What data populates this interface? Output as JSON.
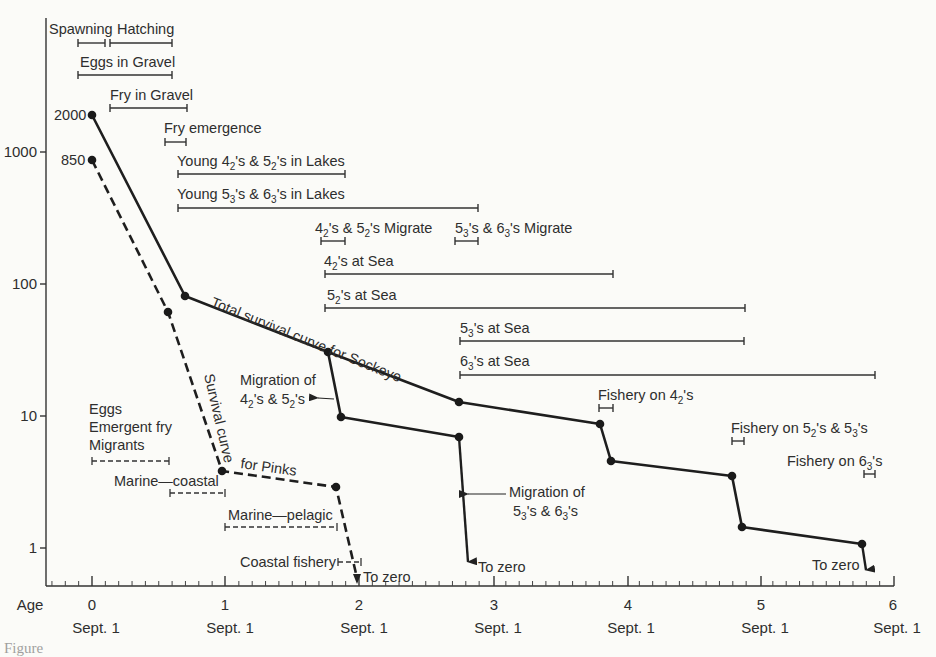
{
  "chart_data": {
    "type": "line",
    "title": "",
    "xlabel": "Age",
    "ylabel": "",
    "yscale": "log",
    "ylim": [
      0.5,
      5000
    ],
    "xlim": [
      -0.35,
      6.05
    ],
    "grid": false,
    "x_ticks": [
      {
        "value": 0,
        "label": "0",
        "sublabel": "Sept. 1"
      },
      {
        "value": 1,
        "label": "1",
        "sublabel": "Sept. 1"
      },
      {
        "value": 2,
        "label": "2",
        "sublabel": "Sept. 1"
      },
      {
        "value": 3,
        "label": "3",
        "sublabel": "Sept. 1"
      },
      {
        "value": 4,
        "label": "4",
        "sublabel": "Sept. 1"
      },
      {
        "value": 5,
        "label": "5",
        "sublabel": "Sept. 1"
      },
      {
        "value": 6,
        "label": "6",
        "sublabel": "Sept. 1"
      }
    ],
    "y_ticks": [
      {
        "value": 1000,
        "label": "1000"
      },
      {
        "value": 100,
        "label": "100"
      },
      {
        "value": 10,
        "label": "10"
      },
      {
        "value": 1,
        "label": "1"
      }
    ],
    "series": [
      {
        "name": "Total survival curve for Sockeye",
        "style": "solid",
        "points": [
          [
            0,
            2000
          ],
          [
            0.7,
            80
          ],
          [
            1.77,
            30
          ],
          [
            2.75,
            12.5
          ],
          [
            3.82,
            8.5
          ],
          [
            3.88,
            4.6
          ],
          [
            4.82,
            3.5
          ],
          [
            4.88,
            1.4
          ],
          [
            5.82,
            1.05
          ]
        ],
        "start_label": "2000",
        "end_arrow": "To zero"
      },
      {
        "name": "Sockeye after migration of 4₂'s & 5₂'s",
        "style": "solid",
        "points": [
          [
            1.77,
            30
          ],
          [
            1.87,
            9.8
          ],
          [
            2.75,
            4.2
          ]
        ],
        "end_arrow": "To zero"
      },
      {
        "name": "Survival curve for Pinks",
        "style": "dashed",
        "points": [
          [
            0,
            850
          ],
          [
            0.58,
            62
          ],
          [
            0.98,
            3.9
          ],
          [
            1.83,
            2.9
          ]
        ],
        "start_label": "850",
        "end_arrow": "To zero"
      }
    ],
    "annotations": [
      {
        "text": "Total survival curve for Sockeye",
        "type": "curve-label"
      },
      {
        "text": "Survival curve for Pinks",
        "type": "curve-label"
      },
      {
        "text": "Migration of 4₂'s & 5₂'s",
        "type": "arrow-label"
      },
      {
        "text": "Migration of 5₃'s & 6₃'s",
        "type": "arrow-label"
      },
      {
        "text": "To zero",
        "type": "arrow-end"
      }
    ],
    "life_stage_bars": [
      {
        "label": "Spawning",
        "x0": -0.1,
        "x1": 0.1,
        "style": "solid"
      },
      {
        "label": "Hatching",
        "x0": 0.14,
        "x1": 0.6,
        "style": "solid"
      },
      {
        "label": "Eggs in Gravel",
        "x0": -0.1,
        "x1": 0.6,
        "style": "solid"
      },
      {
        "label": "Fry in Gravel",
        "x0": 0.15,
        "x1": 0.72,
        "style": "solid"
      },
      {
        "label": "Fry emergence",
        "x0": 0.55,
        "x1": 0.72,
        "style": "solid"
      },
      {
        "label": "Young 4₂'s & 5₂'s in Lakes",
        "x0": 0.65,
        "x1": 1.9,
        "style": "solid"
      },
      {
        "label": "Young 5₃'s & 6₃'s in Lakes",
        "x0": 0.65,
        "x1": 2.9,
        "style": "solid"
      },
      {
        "label": "4₂'s & 5₂'s Migrate",
        "x0": 1.72,
        "x1": 1.9,
        "style": "solid"
      },
      {
        "label": "5₃'s & 6₃'s Migrate",
        "x0": 2.72,
        "x1": 2.9,
        "style": "solid"
      },
      {
        "label": "4₂'s at Sea",
        "x0": 1.75,
        "x1": 3.9,
        "style": "solid"
      },
      {
        "label": "5₂'s at Sea",
        "x0": 1.75,
        "x1": 4.9,
        "style": "solid"
      },
      {
        "label": "5₃'s at Sea",
        "x0": 2.75,
        "x1": 4.9,
        "style": "solid"
      },
      {
        "label": "6₃'s at Sea",
        "x0": 2.75,
        "x1": 5.88,
        "style": "solid"
      },
      {
        "label": "Fishery on 4₂'s",
        "x0": 3.8,
        "x1": 3.9,
        "style": "solid"
      },
      {
        "label": "Fishery on 5₂'s & 5₃'s",
        "x0": 4.8,
        "x1": 4.9,
        "style": "solid"
      },
      {
        "label": "Fishery on 6₃'s",
        "x0": 5.8,
        "x1": 5.88,
        "style": "solid"
      },
      {
        "label": "Eggs / Emergent fry / Migrants",
        "x0": 0,
        "x1": 0.6,
        "style": "dashed"
      },
      {
        "label": "Marine—coastal",
        "x0": 0.6,
        "x1": 1.0,
        "style": "dashed"
      },
      {
        "label": "Marine—pelagic",
        "x0": 1.0,
        "x1": 1.83,
        "style": "dashed"
      },
      {
        "label": "Coastal fishery",
        "x0": 1.85,
        "x1": 2.0,
        "style": "dashed"
      }
    ]
  },
  "labels": {
    "age": "Age",
    "x0": "0",
    "x1": "1",
    "x2": "2",
    "x3": "3",
    "x4": "4",
    "x5": "5",
    "x6": "6",
    "sept": "Sept. 1",
    "y1000": "1000",
    "y100": "100",
    "y10": "10",
    "y1": "1",
    "start_sockeye": "2000",
    "start_pinks": "850",
    "spawning": "Spawning",
    "hatching": "Hatching",
    "eggs_gravel": "Eggs in Gravel",
    "fry_gravel": "Fry  in Gravel",
    "fry_emergence": "Fry emergence",
    "sockeye_curve": "Total survival curve for Sockeye",
    "pinks_curve_a": "Survival curve",
    "pinks_curve_b": "for Pinks",
    "migration_of": "Migration of",
    "to_zero": "To zero",
    "eggs": "Eggs",
    "emergent_fry": "Emergent fry",
    "migrants": "Migrants",
    "marine_coastal": "Marine—coastal",
    "marine_pelagic": "Marine—pelagic",
    "coastal_fishery": "Coastal fishery",
    "caption": "Figure"
  }
}
